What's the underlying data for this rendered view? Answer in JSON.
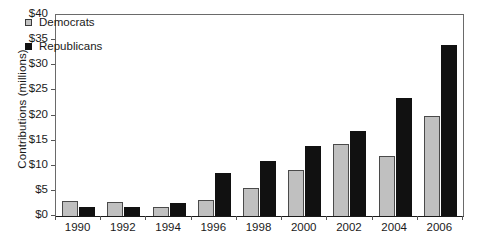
{
  "chart_data": {
    "type": "bar",
    "title": "",
    "xlabel": "",
    "ylabel": "Contributions (millions)",
    "categories": [
      "1990",
      "1992",
      "1994",
      "1996",
      "1998",
      "2000",
      "2002",
      "2004",
      "2006"
    ],
    "series": [
      {
        "name": "Democrats",
        "color": "#c0c0c0",
        "values": [
          3.0,
          2.8,
          1.7,
          3.2,
          5.6,
          9.2,
          14.3,
          12.0,
          20.0
        ]
      },
      {
        "name": "Republicans",
        "color": "#111111",
        "values": [
          1.7,
          1.7,
          2.5,
          8.5,
          11.0,
          14.0,
          17.0,
          23.5,
          34.0
        ]
      }
    ],
    "ylim": [
      0,
      40
    ],
    "y_ticks": [
      "$0",
      "$5",
      "$10",
      "$15",
      "$20",
      "$25",
      "$30",
      "$35",
      "$40"
    ],
    "y_tick_values": [
      0,
      5,
      10,
      15,
      20,
      25,
      30,
      35,
      40
    ],
    "grid": false,
    "legend_position": "top-left"
  },
  "legend": {
    "items": [
      {
        "label": "Democrats",
        "marker": "square-gray"
      },
      {
        "label": "Republicans",
        "marker": "square-black"
      }
    ]
  }
}
